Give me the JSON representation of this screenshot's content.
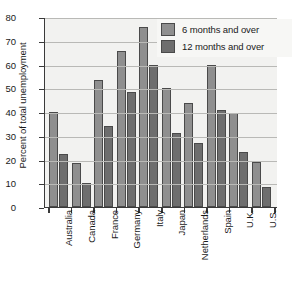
{
  "chart_data": {
    "type": "bar",
    "title": "",
    "xlabel": "",
    "ylabel": "Percent of total unemployment",
    "ylim": [
      0,
      80
    ],
    "ytick_step": 10,
    "yticks": [
      "0",
      "10",
      "20",
      "30",
      "40",
      "50",
      "60",
      "70",
      "80"
    ],
    "grid": true,
    "legend_position": "top-right",
    "categories": [
      "Australia",
      "Canada",
      "France",
      "Germany",
      "Italy",
      "Japan",
      "Netherlands",
      "Spain",
      "U.K.",
      "U.S."
    ],
    "series": [
      {
        "name": "6 months and over",
        "color": "#8f8f8f",
        "values": [
          40,
          18.5,
          53.5,
          65.5,
          76,
          50,
          44,
          60,
          39.5,
          19
        ]
      },
      {
        "name": "12 months and over",
        "color": "#6e6e6e",
        "values": [
          22.5,
          10,
          34,
          48.5,
          60,
          31,
          27,
          41,
          23,
          8.5
        ]
      }
    ]
  },
  "legend": {
    "items": [
      {
        "label": "6 months and over"
      },
      {
        "label": "12 months and over"
      }
    ]
  },
  "colors": {
    "series_6_months": "#8f8f8f",
    "series_12_months": "#6e6e6e",
    "plot_background": "#f2f2f0",
    "gridline": "#b9b9b6",
    "axis": "#3a3a3a",
    "text": "#1a1a1a"
  }
}
